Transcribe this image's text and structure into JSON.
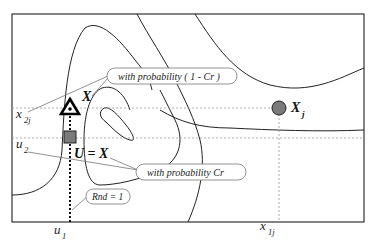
{
  "diagram": {
    "type": "crossover contour illustration",
    "frame": {
      "x": 12,
      "y": 14,
      "width": 352,
      "height": 208
    },
    "colors": {
      "line": "#222222",
      "dashed": "#888888",
      "marker_fill": "#7a7a7a",
      "callout_border": "#777777"
    },
    "points": {
      "target": {
        "label": "X",
        "shape": "triangle",
        "x": 70,
        "y": 108
      },
      "trial": {
        "label": "U = X",
        "shape": "square",
        "x": 70,
        "y": 138
      },
      "donor": {
        "label": "X",
        "sub": "j",
        "shape": "circle",
        "x": 279,
        "y": 108
      }
    },
    "axis_labels": {
      "x2j": {
        "main": "x",
        "sub": "2j"
      },
      "u2": {
        "main": "u",
        "sub": "2"
      },
      "u1": {
        "main": "u",
        "sub": "1"
      },
      "x1j": {
        "main": "x",
        "sub": "1j"
      }
    },
    "callouts": {
      "prob_1_minus_cr": "with probability  ( 1 - Cr )",
      "prob_cr": "with probability  Cr",
      "rnd": "Rnd = 1"
    },
    "labels": {
      "X": "X",
      "Xj_main": "X",
      "Xj_sub": "j",
      "U_eq_X": "U = X"
    }
  }
}
